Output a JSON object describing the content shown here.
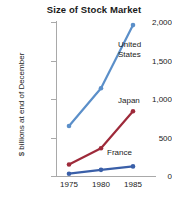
{
  "chart_data": {
    "type": "line",
    "title": "Size of Stock Market",
    "xlabel": "",
    "ylabel": "$ billions at end of December",
    "x": [
      1975,
      1980,
      1985
    ],
    "xtick_labels": [
      "1975",
      "1980",
      "1985"
    ],
    "ytick_values": [
      0,
      500,
      1000,
      1500,
      2000
    ],
    "ytick_labels": [
      "0",
      "500",
      "1,000",
      "1,500",
      "2,000"
    ],
    "ylim": [
      0,
      2000
    ],
    "grid": false,
    "legend_position": "inline-annotations",
    "series": [
      {
        "name": "United States",
        "label": "United\nStates",
        "color": "#5b8fc9",
        "values": [
          650,
          1140,
          1960
        ]
      },
      {
        "name": "Japan",
        "label": "Japan",
        "color": "#9e2a3a",
        "values": [
          150,
          360,
          840
        ]
      },
      {
        "name": "France",
        "label": "France",
        "color": "#3a5fa8",
        "values": [
          30,
          80,
          125
        ]
      }
    ]
  },
  "axis": {
    "line_color": "#a9a9a9"
  },
  "background": "#ffffff"
}
